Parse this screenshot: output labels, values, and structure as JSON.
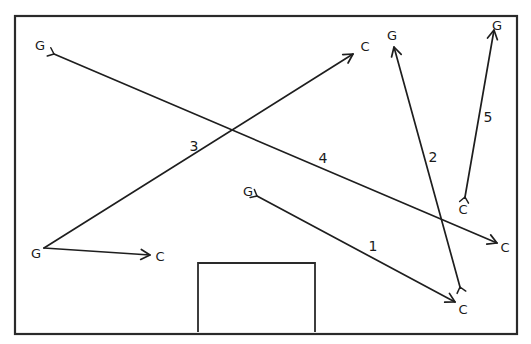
{
  "diagram": {
    "type": "hand-drawn pass/movement diagram",
    "frame": {
      "x1": 15,
      "y1": 16,
      "x2": 517,
      "y2": 334
    },
    "goal_box": {
      "x1": 198,
      "y1": 263,
      "x2": 315,
      "y2": 332
    },
    "node_labels": {
      "g": "G",
      "c": "C"
    },
    "arrows": [
      {
        "id": "1",
        "label": "1",
        "from": {
          "name": "G",
          "x": 257,
          "y": 196,
          "label_x": 248,
          "label_y": 191
        },
        "to": {
          "name": "C",
          "x": 455,
          "y": 302,
          "label_x": 463,
          "label_y": 309
        },
        "head_at": "to",
        "num_pos": {
          "x": 373,
          "y": 246
        }
      },
      {
        "id": "2",
        "label": "2",
        "from": {
          "name": "C",
          "x": 460,
          "y": 287,
          "label_x": 463,
          "label_y": 309
        },
        "to": {
          "name": "G",
          "x": 394,
          "y": 47,
          "label_x": 392,
          "label_y": 35
        },
        "head_at": "to",
        "num_pos": {
          "x": 433,
          "y": 157
        }
      },
      {
        "id": "3",
        "label": "3",
        "from": {
          "name": "G",
          "x": 44,
          "y": 248,
          "label_x": 36,
          "label_y": 253
        },
        "to": {
          "name": "C",
          "x": 353,
          "y": 54,
          "label_x": 365,
          "label_y": 46
        },
        "head_at": "to",
        "num_pos": {
          "x": 194,
          "y": 146
        }
      },
      {
        "id": "4",
        "label": "4",
        "from": {
          "name": "G",
          "x": 54,
          "y": 54,
          "label_x": 40,
          "label_y": 45
        },
        "to": {
          "name": "C",
          "x": 497,
          "y": 243,
          "label_x": 505,
          "label_y": 247
        },
        "head_at": "to",
        "num_pos": {
          "x": 323,
          "y": 158
        }
      },
      {
        "id": "5",
        "label": "5",
        "from": {
          "name": "C",
          "x": 465,
          "y": 197,
          "label_x": 463,
          "label_y": 209
        },
        "to": {
          "name": "G",
          "x": 494,
          "y": 30,
          "label_x": 497,
          "label_y": 25
        },
        "head_at": "to",
        "num_pos": {
          "x": 488,
          "y": 117
        }
      },
      {
        "id": "6",
        "label": "",
        "from": {
          "name": "G",
          "x": 44,
          "y": 248,
          "label_x": 36,
          "label_y": 253
        },
        "to": {
          "name": "C",
          "x": 150,
          "y": 255,
          "label_x": 160,
          "label_y": 256
        },
        "head_at": "to",
        "num_pos": null
      }
    ]
  }
}
